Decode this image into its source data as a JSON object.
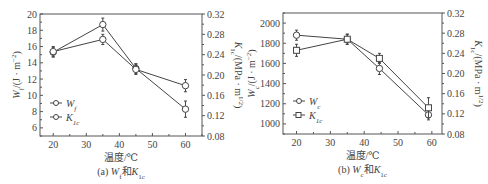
{
  "chart_data": [
    {
      "type": "line",
      "panel": "a",
      "caption": "(a) Wf和K1c",
      "caption_parts": {
        "prefix": "(a) ",
        "sym1": "W",
        "sub1": "f",
        "mid": "和",
        "sym2": "K",
        "sub2": "1c"
      },
      "xlabel": "温度/℃",
      "ylabel_left": "Wf/(J·m⁻²)",
      "ylabel_right": "K1c/(MPa·m^1/2)",
      "x": [
        20,
        35,
        45,
        60
      ],
      "xticks": [
        20,
        30,
        40,
        50,
        60
      ],
      "xlim": [
        16,
        65
      ],
      "ylim_left": [
        5,
        20
      ],
      "yticks_left": [
        6,
        8,
        10,
        12,
        14,
        16,
        18,
        20
      ],
      "ylim_right": [
        0.08,
        0.32
      ],
      "yticks_right": [
        "0.08",
        "0.12",
        "0.16",
        "0.20",
        "0.24",
        "0.28",
        "0.32"
      ],
      "series": [
        {
          "name": "Wf",
          "axis": "left",
          "marker": "circle",
          "values": [
            15.3,
            18.7,
            13.3,
            8.3
          ],
          "errors": [
            0.6,
            0.8,
            0.6,
            1.0
          ]
        },
        {
          "name": "K1c",
          "axis": "right",
          "marker": "circle",
          "values": [
            0.246,
            0.27,
            0.211,
            0.179
          ],
          "errors": [
            0.01,
            0.01,
            0.01,
            0.012
          ]
        }
      ],
      "legend": [
        {
          "sym": "W",
          "sub": "f"
        },
        {
          "sym": "K",
          "sub": "1c"
        }
      ],
      "legend_position": "lower-left"
    },
    {
      "type": "line",
      "panel": "b",
      "caption": "(b) Wc和K1c",
      "caption_parts": {
        "prefix": "(b) ",
        "sym1": "W",
        "sub1": "c",
        "mid": "和",
        "sym2": "K",
        "sub2": "1c"
      },
      "xlabel": "温度/℃",
      "ylabel_left": "Wc/(J·m⁻²)",
      "ylabel_right": "K1c/(MPa·m^1/2)",
      "x": [
        20,
        35,
        44.5,
        59
      ],
      "xticks": [
        20,
        30,
        40,
        50,
        60
      ],
      "xlim": [
        16,
        63
      ],
      "ylim_left": [
        900,
        2100
      ],
      "yticks_left": [
        1000,
        1200,
        1400,
        1600,
        1800,
        2000
      ],
      "ylim_right": [
        0.08,
        0.32
      ],
      "yticks_right": [
        "0.08",
        "0.12",
        "0.16",
        "0.20",
        "0.24",
        "0.28",
        "0.32"
      ],
      "series": [
        {
          "name": "Wc",
          "axis": "left",
          "marker": "circle",
          "values": [
            1880,
            1840,
            1550,
            1090
          ],
          "errors": [
            50,
            50,
            60,
            50
          ]
        },
        {
          "name": "K1c",
          "axis": "right",
          "marker": "square",
          "values": [
            0.246,
            0.268,
            0.23,
            0.132
          ],
          "errors": [
            0.012,
            0.01,
            0.01,
            0.02
          ]
        }
      ],
      "legend": [
        {
          "sym": "W",
          "sub": "c"
        },
        {
          "sym": "K",
          "sub": "1c"
        }
      ],
      "legend_position": "lower-left"
    }
  ]
}
